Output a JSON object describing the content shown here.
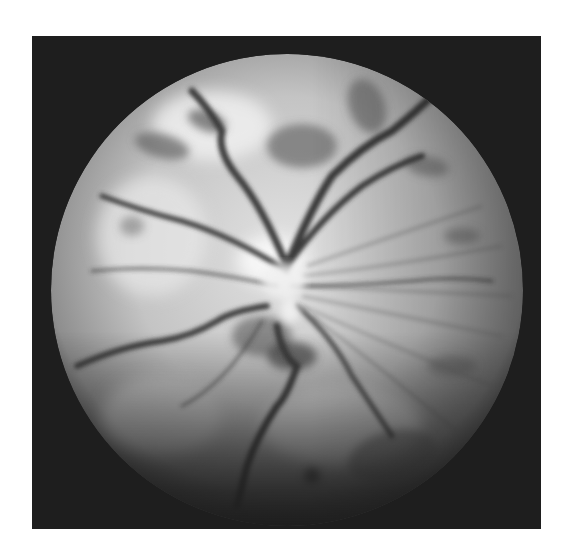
{
  "image": {
    "subject": "grayscale fundus photograph of the retina",
    "elements": [
      "dark rectangular frame",
      "circular field of view",
      "central optic disc with radiating blood vessels",
      "dark patchy hemorrhages"
    ],
    "colors": {
      "page_background": "#ffffff",
      "frame": "#1e1e1e",
      "fundus_light": "#d8d8d8",
      "fundus_mid": "#a8a8a8",
      "vessel": "#3a3a3a"
    }
  }
}
